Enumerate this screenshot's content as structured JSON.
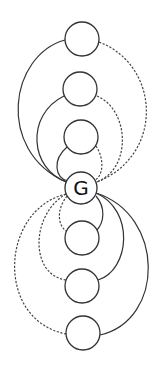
{
  "diagram": {
    "center_node": {
      "label": "G",
      "cx": 81,
      "cy": 188,
      "r": 16
    },
    "upper_nodes": [
      {
        "label": "",
        "cx": 82,
        "cy": 39,
        "r": 17
      },
      {
        "label": "",
        "cx": 80,
        "cy": 89,
        "r": 17
      },
      {
        "label": "",
        "cx": 81,
        "cy": 137,
        "r": 17
      }
    ],
    "lower_nodes": [
      {
        "label": "",
        "cx": 82,
        "cy": 238,
        "r": 17
      },
      {
        "label": "",
        "cx": 82,
        "cy": 286,
        "r": 17
      },
      {
        "label": "",
        "cx": 83,
        "cy": 333,
        "r": 17
      }
    ],
    "edge_styles": {
      "solid": "#333333",
      "dashed": "#444444"
    }
  }
}
